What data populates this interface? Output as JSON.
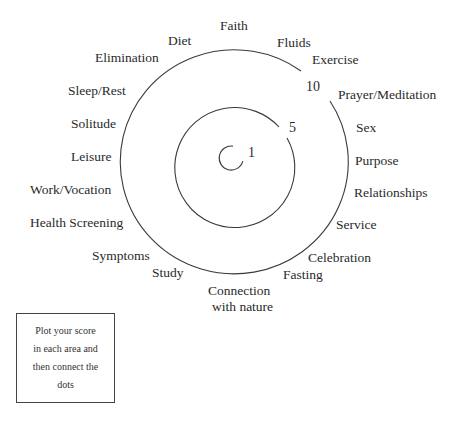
{
  "diagram": {
    "type": "wellness-wheel",
    "rings": [
      {
        "score": 1,
        "label": "1"
      },
      {
        "score": 5,
        "label": "5"
      },
      {
        "score": 10,
        "label": "10"
      }
    ],
    "areas": [
      {
        "id": "faith",
        "label": "Faith",
        "x": 220,
        "y": 30
      },
      {
        "id": "diet",
        "label": "Diet",
        "x": 168,
        "y": 45
      },
      {
        "id": "fluids",
        "label": "Fluids",
        "x": 277,
        "y": 47
      },
      {
        "id": "elimination",
        "label": "Elimination",
        "x": 95,
        "y": 62
      },
      {
        "id": "exercise",
        "label": "Exercise",
        "x": 312,
        "y": 64
      },
      {
        "id": "prayer-meditation",
        "label": "Prayer/Meditation",
        "x": 338,
        "y": 99
      },
      {
        "id": "sleep-rest",
        "label": "Sleep/Rest",
        "x": 68,
        "y": 95
      },
      {
        "id": "solitude",
        "label": "Solitude",
        "x": 71,
        "y": 128
      },
      {
        "id": "sex",
        "label": "Sex",
        "x": 356,
        "y": 132
      },
      {
        "id": "leisure",
        "label": "Leisure",
        "x": 71,
        "y": 161
      },
      {
        "id": "purpose",
        "label": "Purpose",
        "x": 355,
        "y": 165
      },
      {
        "id": "work-vocation",
        "label": "Work/Vocation",
        "x": 30,
        "y": 194
      },
      {
        "id": "relationships",
        "label": "Relationships",
        "x": 354,
        "y": 197
      },
      {
        "id": "health-screening",
        "label": "Health Screening",
        "x": 30,
        "y": 227
      },
      {
        "id": "service",
        "label": "Service",
        "x": 336,
        "y": 229
      },
      {
        "id": "symptoms",
        "label": "Symptoms",
        "x": 92,
        "y": 260
      },
      {
        "id": "celebration",
        "label": "Celebration",
        "x": 308,
        "y": 262
      },
      {
        "id": "study",
        "label": "Study",
        "x": 152,
        "y": 277
      },
      {
        "id": "fasting",
        "label": "Fasting",
        "x": 283,
        "y": 279
      },
      {
        "id": "connection-with-nature",
        "label_line1": "Connection",
        "label_line2": "with nature",
        "x": 208,
        "y": 295
      }
    ]
  },
  "instructions": {
    "lines": [
      "Plot  your score",
      "in each area and",
      "then connect the",
      "dots"
    ]
  }
}
